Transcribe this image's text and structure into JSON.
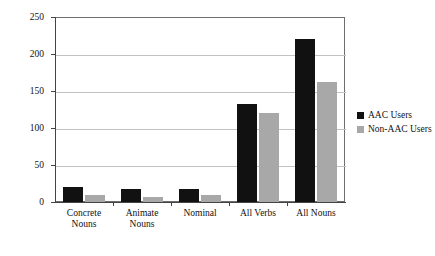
{
  "chart_data": {
    "type": "bar",
    "title": "",
    "xlabel": "",
    "ylabel": "",
    "ylim": [
      0,
      250
    ],
    "yticks": [
      0,
      50,
      100,
      150,
      200,
      250
    ],
    "grid": true,
    "legend_position": "right",
    "categories": [
      "Concrete\nNouns",
      "Animate\nNouns",
      "Nominal",
      "All Verbs",
      "All Nouns"
    ],
    "series": [
      {
        "name": "AAC Users",
        "color": "#111111",
        "values": [
          20,
          18,
          18,
          132,
          220
        ]
      },
      {
        "name": "Non-AAC Users",
        "color": "#a8a8a8",
        "values": [
          10,
          7,
          10,
          120,
          162
        ]
      }
    ]
  },
  "axis": {
    "y_tick_labels": [
      "250",
      "200",
      "150",
      "100",
      "50",
      "0"
    ]
  },
  "legend": {
    "items": [
      {
        "label": "AAC Users",
        "swatch": "black-square-swatch"
      },
      {
        "label": "Non-AAC Users",
        "swatch": "gray-square-swatch"
      }
    ]
  }
}
